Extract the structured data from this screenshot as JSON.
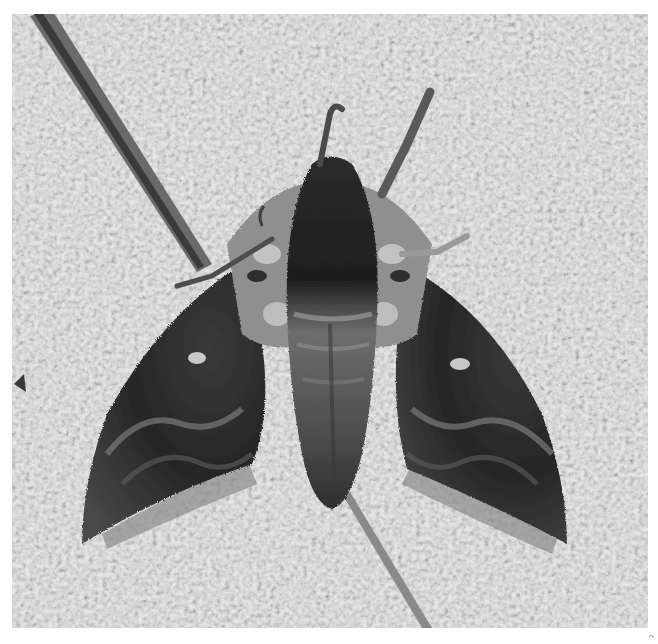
{
  "image": {
    "subject": "hawk moth resting on textured stucco wall",
    "description": "Grayscale close-up photograph of a sphinx/hawk moth with wings spread in a delta shape, dark thorax stripe, pale patches on shoulders, small pale spot on each forewing, antennae pointing up; a thin twig runs diagonally across the frame from upper-left to lower-right.",
    "palette": {
      "background_wall": "#c8c8c8",
      "wall_light": "#e2e2e2",
      "wall_dark": "#9a9a9a",
      "wing_dark": "#2a2a2a",
      "wing_mid": "#5a5a5a",
      "body_mid": "#6e6e6e",
      "pale_patch": "#b5b5b5",
      "twig": "#7a7a7a",
      "page_margin": "#ffffff"
    }
  },
  "corner_mark": {
    "text": "ᴖ"
  }
}
